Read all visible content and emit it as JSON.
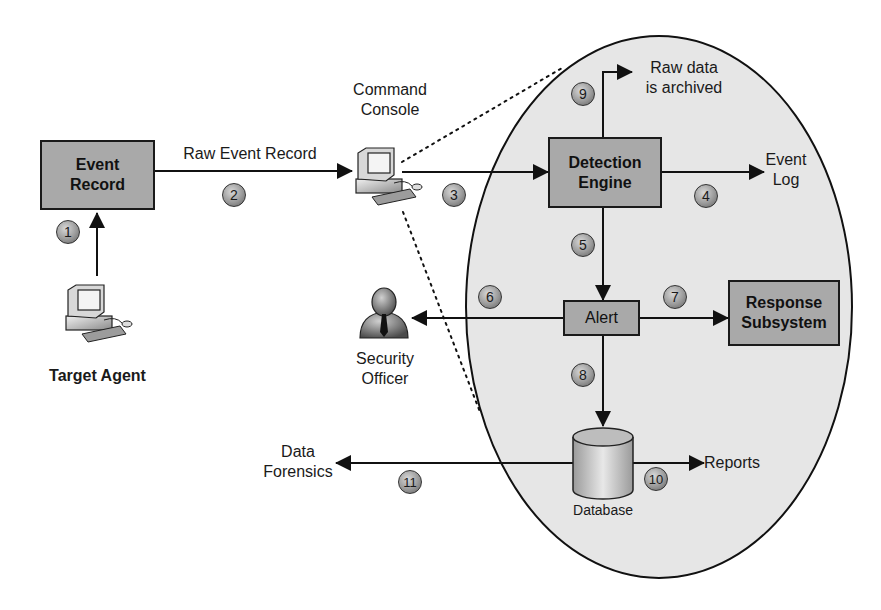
{
  "diagram": {
    "nodes": {
      "event_record": {
        "label_line1": "Event",
        "label_line2": "Record"
      },
      "target_agent": {
        "label": "Target Agent"
      },
      "command_console": {
        "label_line1": "Command",
        "label_line2": "Console"
      },
      "detection_engine": {
        "label_line1": "Detection",
        "label_line2": "Engine"
      },
      "event_log": {
        "label_line1": "Event",
        "label_line2": "Log"
      },
      "raw_data_archived": {
        "label_line1": "Raw data",
        "label_line2": "is archived"
      },
      "alert": {
        "label": "Alert"
      },
      "response_subsystem": {
        "label_line1": "Response",
        "label_line2": "Subsystem"
      },
      "security_officer": {
        "label_line1": "Security",
        "label_line2": "Officer"
      },
      "database": {
        "label": "Database"
      },
      "reports": {
        "label": "Reports"
      },
      "data_forensics": {
        "label_line1": "Data",
        "label_line2": "Forensics"
      }
    },
    "edges": {
      "raw_event_record": {
        "label": "Raw Event Record"
      }
    },
    "steps": [
      "1",
      "2",
      "3",
      "4",
      "5",
      "6",
      "7",
      "8",
      "9",
      "10",
      "11"
    ],
    "colors": {
      "box_fill": "#a9a9a9",
      "ellipse_fill": "#e6e6e6",
      "line": "#1a1a1a",
      "background": "#ffffff"
    }
  }
}
